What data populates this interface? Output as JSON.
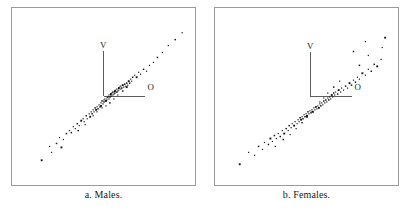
{
  "figure": {
    "panels": [
      {
        "id": "males",
        "caption": "a.  Males.",
        "axis_v_label": "V",
        "axis_o_label": "O",
        "origin": {
          "x": 93,
          "y": 89
        },
        "axis_v_top": 43,
        "axis_o_right": 134,
        "v_label_pos": {
          "x": 89,
          "y": 40
        },
        "o_label_pos": {
          "x": 137,
          "y": 83
        }
      },
      {
        "id": "females",
        "caption": "b.  Females.",
        "axis_v_label": "V",
        "axis_o_label": "O",
        "origin": {
          "x": 97,
          "y": 90
        },
        "axis_v_top": 44,
        "axis_o_right": 138,
        "v_label_pos": {
          "x": 93,
          "y": 41
        },
        "o_label_pos": {
          "x": 141,
          "y": 83
        }
      }
    ],
    "colors": {
      "box_border": "#9a9a9a",
      "axis": "#5b5b5b",
      "point": "#141414",
      "text": "#1a1a1a",
      "background": "#ffffff"
    }
  },
  "chart_data": [
    {
      "type": "scatter",
      "title": "a.  Males.",
      "xlabel": "O",
      "ylabel": "V",
      "grid": false,
      "legend": null,
      "axis_origin_px": [
        93,
        89
      ],
      "note": "Bivariate scatter of male observations relative to V (vertical) and O (horizontal) reference axes; elongated positive-slope cloud with dense core near origin and sparse upper-right outliers.",
      "n_points": 96,
      "points": [
        [
          30,
          154
        ],
        [
          38,
          140
        ],
        [
          40,
          146
        ],
        [
          45,
          137
        ],
        [
          48,
          131
        ],
        [
          52,
          133
        ],
        [
          55,
          127
        ],
        [
          50,
          141
        ],
        [
          58,
          124
        ],
        [
          60,
          126
        ],
        [
          62,
          120
        ],
        [
          64,
          122
        ],
        [
          66,
          117
        ],
        [
          68,
          119
        ],
        [
          70,
          114
        ],
        [
          67,
          124
        ],
        [
          72,
          112
        ],
        [
          73,
          115
        ],
        [
          75,
          109
        ],
        [
          76,
          112
        ],
        [
          78,
          107
        ],
        [
          79,
          110
        ],
        [
          80,
          105
        ],
        [
          74,
          118
        ],
        [
          81,
          107
        ],
        [
          82,
          103
        ],
        [
          83,
          105
        ],
        [
          84,
          101
        ],
        [
          85,
          103
        ],
        [
          86,
          100
        ],
        [
          87,
          102
        ],
        [
          88,
          98
        ],
        [
          82,
          109
        ],
        [
          89,
          100
        ],
        [
          90,
          96
        ],
        [
          90,
          99
        ],
        [
          91,
          94
        ],
        [
          92,
          97
        ],
        [
          93,
          93
        ],
        [
          93,
          95
        ],
        [
          94,
          92
        ],
        [
          86,
          105
        ],
        [
          95,
          94
        ],
        [
          96,
          91
        ],
        [
          96,
          93
        ],
        [
          97,
          90
        ],
        [
          98,
          92
        ],
        [
          98,
          88
        ],
        [
          99,
          90
        ],
        [
          100,
          87
        ],
        [
          91,
          101
        ],
        [
          100,
          89
        ],
        [
          101,
          86
        ],
        [
          102,
          88
        ],
        [
          102,
          85
        ],
        [
          103,
          87
        ],
        [
          104,
          84
        ],
        [
          104,
          86
        ],
        [
          95,
          99
        ],
        [
          105,
          83
        ],
        [
          106,
          85
        ],
        [
          106,
          82
        ],
        [
          107,
          84
        ],
        [
          108,
          81
        ],
        [
          108,
          83
        ],
        [
          109,
          80
        ],
        [
          99,
          96
        ],
        [
          110,
          82
        ],
        [
          110,
          79
        ],
        [
          111,
          81
        ],
        [
          112,
          78
        ],
        [
          113,
          80
        ],
        [
          114,
          77
        ],
        [
          115,
          79
        ],
        [
          103,
          92
        ],
        [
          116,
          76
        ],
        [
          117,
          78
        ],
        [
          118,
          74
        ],
        [
          119,
          76
        ],
        [
          120,
          72
        ],
        [
          121,
          74
        ],
        [
          122,
          70
        ],
        [
          107,
          88
        ],
        [
          124,
          68
        ],
        [
          126,
          70
        ],
        [
          128,
          65
        ],
        [
          130,
          67
        ],
        [
          133,
          62
        ],
        [
          136,
          64
        ],
        [
          139,
          58
        ],
        [
          112,
          84
        ],
        [
          116,
          80
        ],
        [
          143,
          55
        ],
        [
          147,
          50
        ],
        [
          152,
          45
        ],
        [
          158,
          38
        ],
        [
          165,
          32
        ],
        [
          172,
          25
        ]
      ]
    },
    {
      "type": "scatter",
      "title": "b.  Females.",
      "xlabel": "O",
      "ylabel": "V",
      "grid": false,
      "legend": null,
      "axis_origin_px": [
        97,
        90
      ],
      "note": "Bivariate scatter of female observations relative to V (vertical) and O (horizontal) reference axes; broader, more diffuse positive-slope cloud than males with several high outliers.",
      "n_points": 101,
      "points": [
        [
          25,
          158
        ],
        [
          34,
          146
        ],
        [
          40,
          149
        ],
        [
          44,
          140
        ],
        [
          48,
          143
        ],
        [
          50,
          136
        ],
        [
          54,
          138
        ],
        [
          56,
          132
        ],
        [
          58,
          135
        ],
        [
          60,
          129
        ],
        [
          62,
          132
        ],
        [
          64,
          127
        ],
        [
          66,
          130
        ],
        [
          68,
          124
        ],
        [
          70,
          127
        ],
        [
          72,
          122
        ],
        [
          61,
          140
        ],
        [
          74,
          124
        ],
        [
          75,
          119
        ],
        [
          77,
          121
        ],
        [
          78,
          117
        ],
        [
          80,
          119
        ],
        [
          81,
          115
        ],
        [
          83,
          117
        ],
        [
          69,
          133
        ],
        [
          84,
          113
        ],
        [
          85,
          115
        ],
        [
          86,
          111
        ],
        [
          87,
          113
        ],
        [
          88,
          110
        ],
        [
          89,
          112
        ],
        [
          90,
          108
        ],
        [
          76,
          128
        ],
        [
          91,
          110
        ],
        [
          92,
          107
        ],
        [
          93,
          109
        ],
        [
          94,
          105
        ],
        [
          95,
          107
        ],
        [
          96,
          104
        ],
        [
          97,
          106
        ],
        [
          82,
          122
        ],
        [
          98,
          103
        ],
        [
          99,
          105
        ],
        [
          100,
          101
        ],
        [
          101,
          103
        ],
        [
          102,
          100
        ],
        [
          103,
          102
        ],
        [
          104,
          99
        ],
        [
          88,
          116
        ],
        [
          105,
          101
        ],
        [
          106,
          97
        ],
        [
          107,
          99
        ],
        [
          108,
          96
        ],
        [
          109,
          98
        ],
        [
          110,
          94
        ],
        [
          111,
          96
        ],
        [
          93,
          110
        ],
        [
          112,
          93
        ],
        [
          113,
          95
        ],
        [
          114,
          91
        ],
        [
          115,
          93
        ],
        [
          116,
          90
        ],
        [
          117,
          92
        ],
        [
          118,
          88
        ],
        [
          98,
          105
        ],
        [
          119,
          90
        ],
        [
          120,
          86
        ],
        [
          121,
          88
        ],
        [
          122,
          85
        ],
        [
          124,
          87
        ],
        [
          125,
          83
        ],
        [
          127,
          85
        ],
        [
          102,
          100
        ],
        [
          128,
          81
        ],
        [
          130,
          83
        ],
        [
          132,
          79
        ],
        [
          134,
          81
        ],
        [
          136,
          76
        ],
        [
          138,
          78
        ],
        [
          140,
          73
        ],
        [
          106,
          95
        ],
        [
          142,
          75
        ],
        [
          144,
          70
        ],
        [
          146,
          72
        ],
        [
          149,
          66
        ],
        [
          152,
          68
        ],
        [
          155,
          62
        ],
        [
          158,
          64
        ],
        [
          110,
          91
        ],
        [
          114,
          86
        ],
        [
          161,
          57
        ],
        [
          164,
          59
        ],
        [
          168,
          52
        ],
        [
          146,
          58
        ],
        [
          155,
          48
        ],
        [
          169,
          40
        ],
        [
          140,
          44
        ],
        [
          152,
          34
        ],
        [
          172,
          30
        ],
        [
          120,
          80
        ],
        [
          126,
          74
        ]
      ]
    }
  ]
}
